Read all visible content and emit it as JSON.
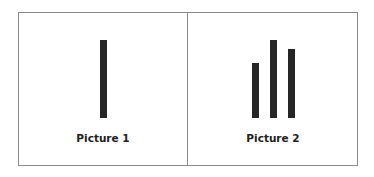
{
  "panels": [
    {
      "label": "Picture 1",
      "bars": [
        {
          "left": 100,
          "top": 40,
          "height": 78
        }
      ]
    },
    {
      "label": "Picture 2",
      "bars": [
        {
          "left": 252,
          "top": 63,
          "height": 55
        },
        {
          "left": 270,
          "top": 40,
          "height": 78
        },
        {
          "left": 288,
          "top": 49,
          "height": 69
        }
      ]
    }
  ],
  "colors": {
    "bar": "#262626",
    "border": "#8a8a8a",
    "background": "#ffffff"
  }
}
